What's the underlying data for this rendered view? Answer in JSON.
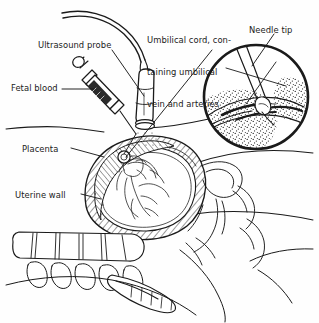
{
  "figure": {
    "type": "line-drawing-medical-illustration",
    "background_color": "#fefefe",
    "ink_color": "#1a1a1a"
  },
  "labels": {
    "ultrasound_probe": "Ultrasound probe",
    "fetal_blood": "Fetal blood",
    "umbilical_cord_line1": "Umbilical cord, con-",
    "umbilical_cord_line2": "taining umbilical",
    "umbilical_cord_line3": "vein and arteries",
    "needle_tip": "Needle tip",
    "placenta": "Placenta",
    "uterine_wall": "Uterine wall"
  },
  "parts": {
    "syringe": "syringe-icon",
    "probe": "ultrasound-probe-icon",
    "probe_cable": "probe-cable",
    "uterus": "uterus-cross-section",
    "fetus": "fetus-figure",
    "placenta_shape": "placenta-hatched-region",
    "spine": "maternal-spine-vertebrae",
    "sacrum": "sacrum",
    "inset_circle": "magnified-inset-circle",
    "inset_needle": "inset-needle-tip",
    "inset_cord": "inset-umbilical-cord"
  },
  "leader_lines": {
    "ultrasound_probe": "from label to probe body",
    "fetal_blood": "from label to syringe barrel",
    "umbilical_cord": "from label down-left to cord in uterus",
    "needle_tip": "from label down-left into inset circle",
    "placenta": "from label right to placenta region",
    "uterine_wall": "from label right to uterine wall"
  }
}
